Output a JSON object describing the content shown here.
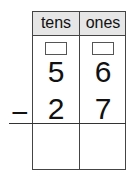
{
  "headers": [
    "tens",
    "ones"
  ],
  "minuend": [
    "5",
    "6"
  ],
  "subtrahend": [
    "2",
    "7"
  ],
  "operator": "−"
}
